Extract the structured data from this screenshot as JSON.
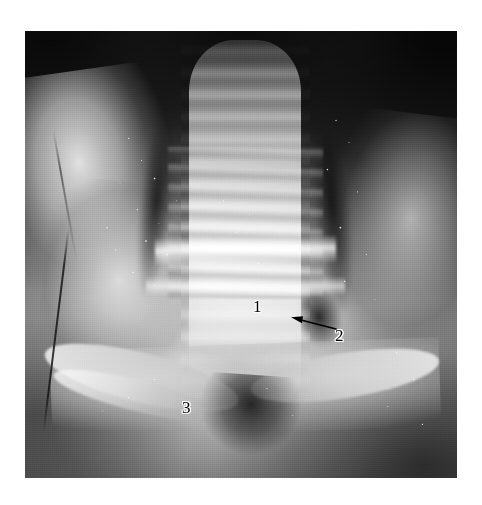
{
  "figure": {
    "type": "anatomical-photograph",
    "modality": "gross surgical dissection photograph",
    "color_mode": "grayscale",
    "page_background": "#ffffff",
    "photo_border_tone": "#6d6d6d",
    "annotation_color": "#000000",
    "annotation_halo_color": "#ffffff"
  },
  "annotations": {
    "label_1": "1",
    "label_2": "2",
    "label_3": "3",
    "arrow": {
      "name": "leader-arrow",
      "direction": "left",
      "points_from_label": "2",
      "color": "#000000"
    }
  }
}
